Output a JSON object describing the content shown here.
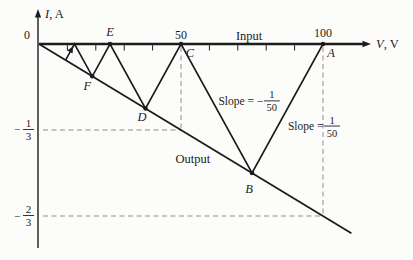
{
  "figure": {
    "background": "#fcfcfa",
    "ink_color": "#1c1c1c",
    "guide_color": "#8d8d8d",
    "origin_label": "0",
    "x_axis_var": "V",
    "x_axis_unit": "V",
    "y_axis_var": "I",
    "y_axis_unit": "A"
  },
  "chart_data": {
    "type": "line",
    "title": "",
    "xlabel": "V, V",
    "ylabel": "I, A",
    "xlim": [
      0,
      115
    ],
    "ylim": [
      -0.78,
      0.13
    ],
    "grid": "off",
    "x_major_ticks": [
      {
        "value": 0,
        "label": "0"
      },
      {
        "value": 50,
        "label": "50"
      },
      {
        "value": 100,
        "label": "100"
      }
    ],
    "x_minor_tick_values": [
      10,
      20,
      30,
      40,
      60,
      70,
      80,
      90
    ],
    "y_guides": [
      {
        "minus": "−",
        "num": "1",
        "den": "3",
        "value": -0.33333
      },
      {
        "minus": "−",
        "num": "2",
        "den": "3",
        "value": -0.66667
      }
    ],
    "series": [
      {
        "name": "output-line",
        "label": "Output",
        "points": [
          [
            0,
            0
          ],
          [
            110,
            -0.73333
          ]
        ]
      },
      {
        "name": "bounce-trajectory",
        "points": [
          [
            100,
            0
          ],
          [
            75,
            -0.5
          ],
          [
            50,
            0
          ],
          [
            37.5,
            -0.25
          ],
          [
            25,
            0
          ],
          [
            18.75,
            -0.125
          ],
          [
            12.5,
            0
          ],
          [
            9.375,
            -0.0625
          ]
        ],
        "point_labels": [
          "A",
          "B",
          "C",
          "D",
          "E",
          "F",
          "",
          ""
        ],
        "dot_point_indices": [
          0,
          1,
          2,
          3,
          4,
          5
        ]
      }
    ],
    "dashed_guides": [
      {
        "name": "v50-vertical",
        "from": [
          50,
          0
        ],
        "to": [
          50,
          -0.33333
        ]
      },
      {
        "name": "third-horizontal",
        "from": [
          0,
          -0.33333
        ],
        "to": [
          50,
          -0.33333
        ]
      },
      {
        "name": "v100-vertical",
        "from": [
          100,
          0
        ],
        "to": [
          100,
          -0.66667
        ]
      },
      {
        "name": "two-thirds-horizontal",
        "from": [
          0,
          -0.66667
        ],
        "to": [
          100,
          -0.66667
        ]
      }
    ],
    "annotations": [
      {
        "id": "input-label",
        "text": "Input",
        "anchor": [
          74,
          0.03
        ]
      },
      {
        "id": "output-label",
        "text": "Output",
        "anchor": [
          54.2,
          -0.448
        ]
      },
      {
        "id": "slope-negative-label",
        "prefix": "Slope = −",
        "frac_num": "1",
        "frac_den": "50",
        "anchor": [
          73,
          -0.2205
        ]
      },
      {
        "id": "slope-positive-label",
        "prefix": "Slope = ",
        "frac_num": "1",
        "frac_den": "50",
        "anchor": [
          94.2,
          -0.318
        ]
      }
    ]
  }
}
